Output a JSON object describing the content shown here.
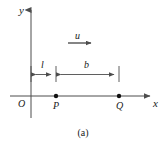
{
  "figure": {
    "caption": "(a)",
    "background_color": "#ffffff",
    "stroke_color": "#4d4d4d",
    "text_color": "#1a1a1a",
    "width": 166,
    "height": 146,
    "axes": {
      "y_label": "y",
      "x_label": "x",
      "origin_label": "O",
      "y_axis": {
        "x": 31,
        "y_top": 8,
        "y_bottom": 118
      },
      "x_axis": {
        "y": 96,
        "x_left": 10,
        "x_right": 152
      }
    },
    "points": [
      {
        "name": "P",
        "label": "P",
        "x": 56,
        "y": 96
      },
      {
        "name": "Q",
        "label": "Q",
        "x": 119,
        "y": 96
      }
    ],
    "velocity_arrow": {
      "label": "u",
      "direction": "right",
      "x_start": 68,
      "x_end": 92,
      "y": 43
    },
    "dimensions": [
      {
        "label": "l",
        "x_start": 31,
        "x_end": 56,
        "y": 74
      },
      {
        "label": "b",
        "x_start": 56,
        "x_end": 119,
        "y": 74
      }
    ],
    "tick_marks": [
      {
        "x": 31,
        "y_top": 66,
        "y_bottom": 82
      },
      {
        "x": 56,
        "y_top": 66,
        "y_bottom": 82
      },
      {
        "x": 119,
        "y_top": 66,
        "y_bottom": 82
      }
    ]
  }
}
